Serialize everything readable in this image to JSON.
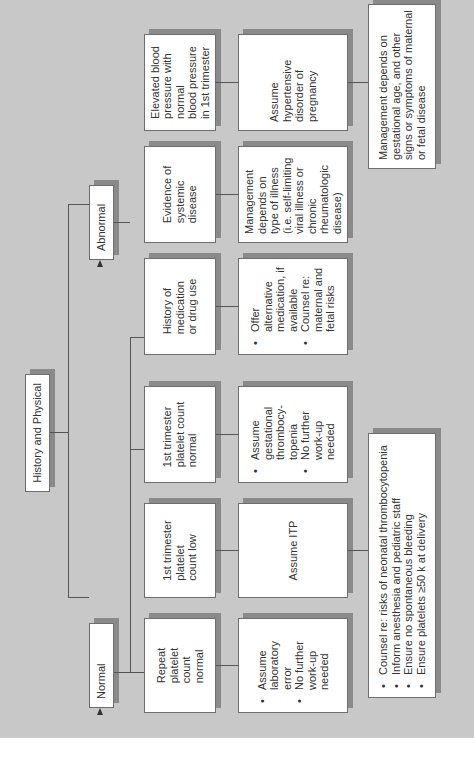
{
  "root": {
    "label": "History and Physical"
  },
  "branches": [
    {
      "label": "Normal",
      "findings": [
        {
          "label": "1st trimester\nplatelet count\nnormal",
          "outcome": [
            "Assume\ngestational\nthrombocy-\ntopenia",
            "No further\nwork-up\nneeded"
          ]
        },
        {
          "label": "1st trimester\nplatelet\ncount low",
          "outcome_text": "Assume ITP"
        },
        {
          "label": "Repeat\nplatelet\ncount\nnormal",
          "outcome": [
            "Assume\nlaboratory\nerror",
            "No further\nwork-up\nneeded"
          ]
        }
      ]
    },
    {
      "label": "Abnormal",
      "findings": [
        {
          "label": "Elevated blood\npressure with\nnormal\nblood pressure\nin 1st trimester",
          "outcome_text": "Assume\nhypertensive\ndisorder of\npregnancy"
        },
        {
          "label": "Evidence of\nsystemic\ndisease",
          "outcome_text": "Management\ndepends on\ntype of illness\n(i.e. self-limiting\nviral illness or\nchronic\nrheumatologic\ndisease)"
        },
        {
          "label": "History of\nmedication\nor drug use",
          "outcome": [
            "Offer alternative\nmedication, if\navailable",
            "Counsel re:\nmaternal and\nfetal risks"
          ]
        }
      ]
    }
  ],
  "itp_management": [
    "Counsel re: risks of neonatal thrombocytopenia",
    "Inform anesthesia and pediatric staff",
    "Ensure no spontaneous bleeding",
    "Ensure platelets ≥50 k at delivery"
  ],
  "hypertension_management": "Management depends on\ngestational age, and other\nsigns or symptoms of maternal\nor fetal disease",
  "colors": {
    "background": "#c8c8c8",
    "box": "#ffffff",
    "shadow": "#8a8a8a",
    "line": "#555555"
  }
}
